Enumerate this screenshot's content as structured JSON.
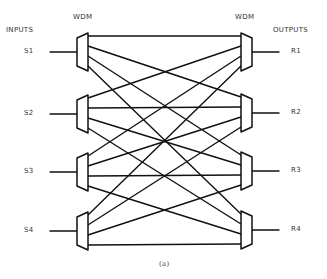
{
  "labels": {
    "inputs": "INPUTS",
    "outputs": "OUTPUTS",
    "wdm_left": "WDM",
    "wdm_right": "WDM",
    "caption": "(a)"
  },
  "inputs": [
    {
      "label": "S1",
      "y": 52
    },
    {
      "label": "S2",
      "y": 114
    },
    {
      "label": "S3",
      "y": 172
    },
    {
      "label": "S4",
      "y": 231
    }
  ],
  "outputs": [
    {
      "label": "R1",
      "y": 52
    },
    {
      "label": "R2",
      "y": 113
    },
    {
      "label": "R3",
      "y": 171
    },
    {
      "label": "R4",
      "y": 230
    }
  ],
  "geometry": {
    "left_wdm": {
      "narrow_x": 77,
      "wide_x": 88,
      "narrow_half": 14,
      "wide_half": 19
    },
    "right_wdm": {
      "wide_x": 241,
      "narrow_x": 252,
      "narrow_half": 14,
      "wide_half": 19
    },
    "input_line_start_x": 50,
    "output_line_end_x": 279,
    "port_offsets": [
      -16,
      -6,
      4,
      14
    ]
  },
  "connections": "full-mesh: each input port i of source WDM s connects to output WDM i on port s"
}
